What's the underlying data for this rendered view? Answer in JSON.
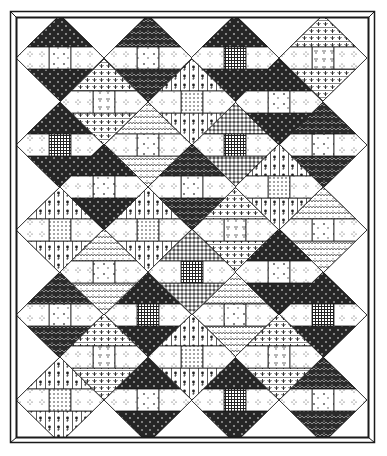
{
  "illustration": {
    "title": "",
    "subject": "spool quilt pattern",
    "colors": {
      "ink": "#1a1a1a",
      "paper": "#ffffff",
      "dark_fabric": "#2a2a2a",
      "mid_fabric": "#8a8a8a"
    },
    "frame": {
      "outer": [
        10,
        11,
        375,
        443
      ],
      "inner": [
        16,
        17,
        369,
        438
      ]
    },
    "block": {
      "half_width": 44,
      "half_height": 43
    },
    "blocks": [
      {
        "x": 60,
        "y": 58,
        "ends": "dark",
        "center": "light"
      },
      {
        "x": 60,
        "y": 145,
        "ends": "dark",
        "center": "grid"
      },
      {
        "x": 60,
        "y": 230,
        "ends": "floral",
        "center": "dots"
      },
      {
        "x": 60,
        "y": 315,
        "ends": "darkzig",
        "center": "light"
      },
      {
        "x": 60,
        "y": 400,
        "ends": "floral",
        "center": "dots"
      },
      {
        "x": 148,
        "y": 58,
        "ends": "darkzig",
        "center": "light"
      },
      {
        "x": 148,
        "y": 145,
        "ends": "zigzag",
        "center": "light"
      },
      {
        "x": 148,
        "y": 230,
        "ends": "floral",
        "center": "dots"
      },
      {
        "x": 148,
        "y": 315,
        "ends": "dark",
        "center": "grid"
      },
      {
        "x": 148,
        "y": 400,
        "ends": "dark",
        "center": "light"
      },
      {
        "x": 235,
        "y": 58,
        "ends": "dark",
        "center": "grid"
      },
      {
        "x": 235,
        "y": 145,
        "ends": "check",
        "center": "grid"
      },
      {
        "x": 235,
        "y": 230,
        "ends": "fan",
        "center": "tri"
      },
      {
        "x": 235,
        "y": 315,
        "ends": "zigzag",
        "center": "light"
      },
      {
        "x": 235,
        "y": 400,
        "ends": "dark",
        "center": "grid"
      },
      {
        "x": 323,
        "y": 58,
        "ends": "fan",
        "center": "tri"
      },
      {
        "x": 323,
        "y": 145,
        "ends": "darkzig",
        "center": "light"
      },
      {
        "x": 323,
        "y": 230,
        "ends": "zigzag",
        "center": "light"
      },
      {
        "x": 323,
        "y": 315,
        "ends": "dark",
        "center": "grid"
      },
      {
        "x": 323,
        "y": 400,
        "ends": "darkzig",
        "center": "light"
      },
      {
        "x": 104,
        "y": 102,
        "ends": "fan",
        "center": "tri"
      },
      {
        "x": 104,
        "y": 187,
        "ends": "dark",
        "center": "light"
      },
      {
        "x": 104,
        "y": 272,
        "ends": "zigzag",
        "center": "light"
      },
      {
        "x": 104,
        "y": 357,
        "ends": "fan",
        "center": "tri"
      },
      {
        "x": 192,
        "y": 102,
        "ends": "floral",
        "center": "dots"
      },
      {
        "x": 192,
        "y": 187,
        "ends": "darkzig",
        "center": "light"
      },
      {
        "x": 192,
        "y": 272,
        "ends": "check",
        "center": "grid"
      },
      {
        "x": 192,
        "y": 357,
        "ends": "floral",
        "center": "dots"
      },
      {
        "x": 279,
        "y": 102,
        "ends": "dark",
        "center": "light"
      },
      {
        "x": 279,
        "y": 187,
        "ends": "floral",
        "center": "dots"
      },
      {
        "x": 279,
        "y": 272,
        "ends": "dark",
        "center": "light"
      },
      {
        "x": 279,
        "y": 357,
        "ends": "fan",
        "center": "tri"
      }
    ]
  }
}
